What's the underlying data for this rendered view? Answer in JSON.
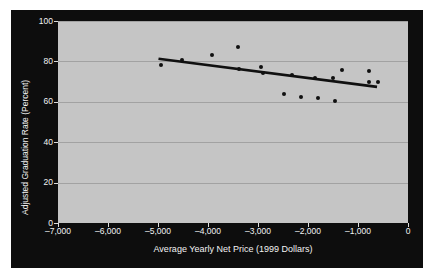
{
  "chart_data": {
    "type": "scatter",
    "title": "",
    "xlabel": "Average Yearly Net Price (1999 Dollars)",
    "ylabel": "Adjusted Graduation Rate (Percent)",
    "xlim": [
      -7000,
      0
    ],
    "ylim": [
      0,
      100
    ],
    "xticks": [
      -7000,
      -6000,
      -5000,
      -4000,
      -3000,
      -2000,
      -1000,
      0
    ],
    "xticklabels": [
      "–7,000",
      "–6,000",
      "–5,000",
      "–4,000",
      "–3,000",
      "–2,000",
      "–1,000",
      "0"
    ],
    "yticks": [
      0,
      20,
      40,
      60,
      80,
      100
    ],
    "yticklabels": [
      "0",
      "20",
      "40",
      "60",
      "80",
      "100"
    ],
    "grid": "horizontal",
    "legend": "none",
    "series": [
      {
        "name": "Institutions",
        "marker": "filled-circle",
        "color": "#101010",
        "points": [
          {
            "x": -4950,
            "y": 78.0
          },
          {
            "x": -4520,
            "y": 80.8
          },
          {
            "x": -3930,
            "y": 83.0
          },
          {
            "x": -3400,
            "y": 87.0
          },
          {
            "x": -3380,
            "y": 76.4
          },
          {
            "x": -2950,
            "y": 77.2
          },
          {
            "x": -2900,
            "y": 74.4
          },
          {
            "x": -2490,
            "y": 63.8
          },
          {
            "x": -2320,
            "y": 73.2
          },
          {
            "x": -2150,
            "y": 62.2
          },
          {
            "x": -1860,
            "y": 71.8
          },
          {
            "x": -1810,
            "y": 62.0
          },
          {
            "x": -1500,
            "y": 71.6
          },
          {
            "x": -1470,
            "y": 60.6
          },
          {
            "x": -1330,
            "y": 75.6
          },
          {
            "x": -790,
            "y": 75.2
          },
          {
            "x": -780,
            "y": 70.0
          },
          {
            "x": -600,
            "y": 69.6
          }
        ]
      }
    ],
    "trend_line": {
      "name": "Fitted regression line",
      "color": "#101010",
      "x_start": -4990,
      "y_start": 81.3,
      "x_end": -620,
      "y_end": 67.4
    },
    "colors": {
      "figure_background": "#0d0d0d",
      "plot_background": "#c5c5c5",
      "gridline": "#a2a2a2",
      "axis_text": "#f2f2f2",
      "marker": "#101010",
      "trend_line": "#101010"
    }
  }
}
